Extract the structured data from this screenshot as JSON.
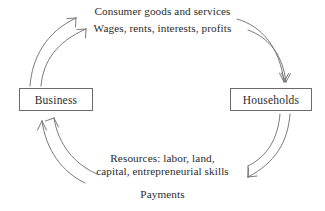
{
  "diagram": {
    "type": "circular-flow",
    "stroke_color": "#6b6b6b",
    "text_color": "#2b2b2b",
    "background_color": "#ffffff",
    "entities": [
      {
        "id": "business",
        "label": "Business"
      },
      {
        "id": "households",
        "label": "Households"
      }
    ],
    "labels": {
      "top_primary": "Consumer goods and services",
      "top_secondary": "Wages, rents, interests, profits",
      "bottom_primary_line1": "Resources: labor, land,",
      "bottom_primary_line2": "capital, entrepreneurial skills",
      "bottom_secondary": "Payments"
    },
    "flows": [
      {
        "id": "flow-top-outer",
        "from": "households",
        "to": "business",
        "label": "Consumer goods and services",
        "direction": "right-to-left-over-top",
        "arrowhead": "up-left"
      },
      {
        "id": "flow-top-inner",
        "from": "households",
        "to": "business",
        "label": "Wages, rents, interests, profits",
        "direction": "right-to-left-over-top",
        "arrowhead": "up-left"
      },
      {
        "id": "flow-right-outer",
        "from": "business",
        "to": "households",
        "direction": "down-right",
        "arrowhead": "down"
      },
      {
        "id": "flow-right-inner",
        "from": "business",
        "to": "households",
        "direction": "down-right",
        "arrowhead": "down"
      },
      {
        "id": "flow-bottom-outer",
        "from": "households",
        "to": "business",
        "label": "Resources: labor, land, capital, entrepreneurial skills",
        "direction": "right-to-left-under-bottom",
        "arrowhead": "up-right"
      },
      {
        "id": "flow-bottom-inner",
        "from": "households",
        "to": "business",
        "label": "Payments",
        "direction": "right-to-left-under-bottom",
        "arrowhead": "up-right"
      }
    ]
  }
}
